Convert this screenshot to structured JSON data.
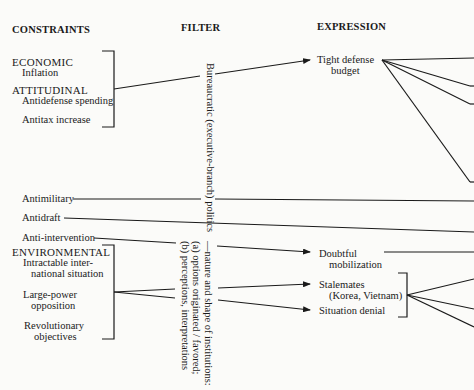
{
  "headers": {
    "constraints": "CONSTRAINTS",
    "filter": "FILTER",
    "expression": "EXPRESSION"
  },
  "constraints": {
    "economic": {
      "label": "ECONOMIC",
      "items": [
        "Inflation"
      ]
    },
    "attitudinal": {
      "label": "ATTITUDINAL",
      "items": [
        "Antidefense spending",
        "Antitax increase"
      ]
    },
    "standalone": [
      "Antimilitary",
      "Antidraft",
      "Anti-intervention"
    ],
    "environmental": {
      "label": "ENVIRONMENTAL",
      "items": [
        {
          "line1": "Intractable inter-",
          "line2": "national situation"
        },
        {
          "line1": "Large-power",
          "line2": "opposition"
        },
        {
          "line1": "Revolutionary",
          "line2": "objectives"
        }
      ]
    }
  },
  "filter": {
    "primary": "Bureaucratic (executive-branch) politics",
    "secondary_line1": "—nature and shape of institutions:",
    "secondary_line2": "(a) options originated / favored;",
    "secondary_line3": "(b) perceptions, interpretations"
  },
  "expression": {
    "tight_budget": {
      "line1": "Tight defense",
      "line2": "budget"
    },
    "doubtful_mobilization": {
      "line1": "Doubtful",
      "line2": "mobilization"
    },
    "stalemates": {
      "line1": "Stalemates",
      "line2": "(Korea, Vietnam)"
    },
    "situation_denial": "Situation denial"
  },
  "colors": {
    "ink": "#1a1a1a",
    "paper": "#fbfbf9"
  }
}
